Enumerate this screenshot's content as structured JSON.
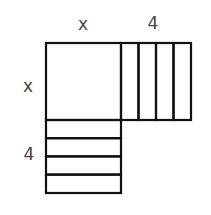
{
  "diagram": {
    "labels": {
      "top_x": "x",
      "top_4": "4",
      "left_x": "x",
      "left_4": "4"
    },
    "pieces": {
      "square": {
        "name": "x-by-x square",
        "count": 1
      },
      "right_strips": {
        "name": "1-by-x strips (right)",
        "count": 4
      },
      "bottom_strips": {
        "name": "x-by-1 strips (bottom)",
        "count": 4
      }
    },
    "colors": {
      "stroke": "#111111",
      "label": "#444444",
      "background": "#ffffff"
    }
  }
}
